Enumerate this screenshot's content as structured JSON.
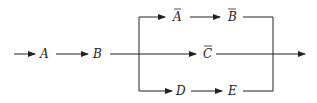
{
  "diagram": {
    "type": "flow-block-diagram",
    "nodes": {
      "A": "A",
      "B": "B",
      "A_bar": "A",
      "B_bar": "B",
      "C_bar": "C",
      "D": "D",
      "E": "E"
    },
    "overbars": [
      "A_bar",
      "B_bar",
      "C_bar"
    ],
    "branches": [
      {
        "name": "upper",
        "sequence": [
          "A_bar",
          "B_bar"
        ]
      },
      {
        "name": "middle",
        "sequence": [
          "C_bar"
        ]
      },
      {
        "name": "lower",
        "sequence": [
          "D",
          "E"
        ]
      }
    ],
    "colors": {
      "line": "#222222",
      "background": "#ffffff"
    }
  }
}
